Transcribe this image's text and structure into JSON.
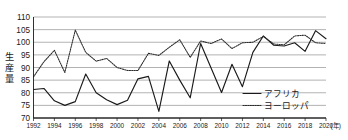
{
  "chart_data": {
    "type": "line",
    "title": "",
    "xlabel": "(年)",
    "ylabel": "生産量",
    "xlim": [
      1992,
      2020
    ],
    "ylim": [
      70,
      110
    ],
    "ytick_step": 5,
    "xtick_step": 2,
    "grid": true,
    "legend_position": "bottom-right",
    "yticks": [
      "110",
      "105",
      "100",
      "95",
      "90",
      "85",
      "80",
      "75",
      "70"
    ],
    "xticks": [
      "1992",
      "1994",
      "1996",
      "1998",
      "2000",
      "2002",
      "2004",
      "2006",
      "2008",
      "2010",
      "2012",
      "2014",
      "2016",
      "2018",
      "2020"
    ],
    "x": [
      1992,
      1993,
      1994,
      1995,
      1996,
      1997,
      1998,
      1999,
      2000,
      2001,
      2002,
      2003,
      2004,
      2005,
      2006,
      2007,
      2008,
      2009,
      2010,
      2011,
      2012,
      2013,
      2014,
      2015,
      2016,
      2017,
      2018,
      2019,
      2020
    ],
    "series": [
      {
        "name": "アフリカ",
        "style": "solid",
        "color": "#1a1a1a",
        "values": [
          81.3,
          81.7,
          76.8,
          75.0,
          76.5,
          87.4,
          80.0,
          77.2,
          75.3,
          77.0,
          85.5,
          86.5,
          72.6,
          92.6,
          85.0,
          78.0,
          99.5,
          89.8,
          80.1,
          91.3,
          82.4,
          96.0,
          102.5,
          98.8,
          98.5,
          99.8,
          96.4,
          104.6,
          101.4
        ]
      },
      {
        "name": "ヨーロッパ",
        "style": "dotted",
        "color": "#2a2a2a",
        "values": [
          86.3,
          92.3,
          96.8,
          88.0,
          104.8,
          96.0,
          92.5,
          93.6,
          90.0,
          88.8,
          88.8,
          95.6,
          94.8,
          98.0,
          101.0,
          94.0,
          100.5,
          99.5,
          101.3,
          97.5,
          99.8,
          100.0,
          102.3,
          99.3,
          99.0,
          102.5,
          102.8,
          99.8,
          99.5
        ]
      }
    ]
  },
  "legend": {
    "items": [
      {
        "label": "アフリカ",
        "style": "solid"
      },
      {
        "label": "ヨーロッパ",
        "style": "dotted"
      }
    ]
  },
  "axes": {
    "y_title": "生産量",
    "x_unit": "(年)"
  }
}
